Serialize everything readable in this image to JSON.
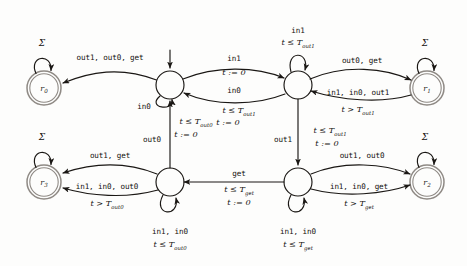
{
  "figure": {
    "type": "timed-automaton-diagram",
    "alphabet_symbol": "Σ",
    "colors": {
      "accent": "#8f8a85",
      "stroke": "#1a1714",
      "background": "#fdfdfc"
    }
  },
  "states": [
    {
      "id": "r0",
      "label": "r",
      "sub": "0",
      "cx": 44,
      "cy": 88,
      "r": 17,
      "double": true,
      "accepting": true,
      "initial": false
    },
    {
      "id": "r1",
      "label": "r",
      "sub": "1",
      "cx": 427,
      "cy": 88,
      "r": 17,
      "double": true,
      "accepting": true,
      "initial": false
    },
    {
      "id": "r2",
      "label": "r",
      "sub": "2",
      "cx": 427,
      "cy": 182,
      "r": 17,
      "double": true,
      "accepting": true,
      "initial": false
    },
    {
      "id": "r3",
      "label": "r",
      "sub": "3",
      "cx": 44,
      "cy": 182,
      "r": 17,
      "double": true,
      "accepting": true,
      "initial": false
    },
    {
      "id": "q_tl",
      "label": "",
      "sub": "",
      "cx": 170,
      "cy": 85,
      "r": 14,
      "double": false,
      "accepting": false,
      "initial": true
    },
    {
      "id": "q_tr",
      "label": "",
      "sub": "",
      "cx": 298,
      "cy": 85,
      "r": 14,
      "double": false,
      "accepting": false,
      "initial": false
    },
    {
      "id": "q_bl",
      "label": "",
      "sub": "",
      "cx": 170,
      "cy": 182,
      "r": 14,
      "double": false,
      "accepting": false,
      "initial": false
    },
    {
      "id": "q_br",
      "label": "",
      "sub": "",
      "cx": 298,
      "cy": 182,
      "r": 14,
      "double": false,
      "accepting": false,
      "initial": false
    }
  ],
  "labels": {
    "sigma_r0": "Σ",
    "sigma_r1": "Σ",
    "sigma_r2": "Σ",
    "sigma_r3": "Σ",
    "tl_to_r0_action": "out1, out0, get",
    "tl_self_action": "in0",
    "tl_to_tr_action": "in1",
    "tl_to_tr_guard": "t := 0",
    "tr_to_tl_action": "in0",
    "tr_to_tl_guard1": "t ≤ T",
    "tr_to_tl_guard1_sub": "out1",
    "tr_to_tl_guard2": "t := 0",
    "tr_self_action": "in1",
    "tr_self_guard": "t ≤ T",
    "tr_self_guard_sub": "out1",
    "tr_to_r1_action": "out0, get",
    "tr_to_r1_action2": "in1, in0, out1",
    "tr_to_r1_guard": "t > T",
    "tr_to_r1_guard_sub": "out1",
    "tr_to_br_action": "out1",
    "tr_to_br_guard1": "t ≤ T",
    "tr_to_br_guard1_sub": "out1",
    "tr_to_br_guard2": "t := 0",
    "bl_to_tl_action": "out0",
    "bl_to_tl_guard1": "t ≤ T",
    "bl_to_tl_guard1_sub": "out0",
    "bl_to_tl_guard2": "t := 0",
    "bl_to_r3_action": "out1, get",
    "bl_to_r3_action2": "in1, in0, out0",
    "bl_to_r3_guard": "t > T",
    "bl_to_r3_guard_sub": "out0",
    "bl_self_action": "in1, in0",
    "bl_self_guard": "t ≤ T",
    "bl_self_guard_sub": "out0",
    "br_to_bl_action": "get",
    "br_to_bl_guard1": "t ≤ T",
    "br_to_bl_guard1_sub": "get",
    "br_to_bl_guard2": "t := 0",
    "br_self_action": "in1, in0",
    "br_self_guard": "t ≤ T",
    "br_self_guard_sub": "get",
    "br_to_r2_action": "out1, out0",
    "br_to_r2_action2": "in1, in0, get",
    "br_to_r2_guard": "t > T",
    "br_to_r2_guard_sub": "get"
  }
}
